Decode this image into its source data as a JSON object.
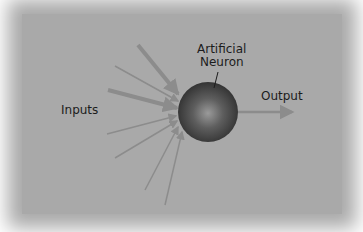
{
  "diagram": {
    "title_label": "Artificial",
    "title_label_line2": "Neuron",
    "inputs_label": "Inputs",
    "output_label": "Output",
    "colors": {
      "background": "#a9a9a9",
      "arrow": "#8c8c8c",
      "neuron_dark": "#3a3a3a",
      "neuron_light": "#8a8a8a",
      "text": "#1c1c1c"
    },
    "input_arrow_count": 8,
    "output_arrow_count": 1
  }
}
